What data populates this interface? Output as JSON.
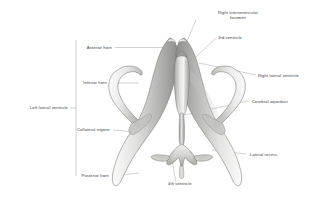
{
  "figure": {
    "view": "anterior-superior oblique",
    "style": "pencil-shaded anatomical illustration",
    "colors": {
      "leader_line": "#8c8c8c",
      "label_text": "#3c3c3c",
      "background": "#ffffff",
      "cast_light": "#f2f2f0",
      "cast_mid": "#c9c9c6",
      "cast_dark": "#8e8e8b",
      "outline": "#5a5a58"
    }
  },
  "labels": {
    "anterior_horn": "Anterior horn",
    "inferior_horn": "Inferior horn",
    "left_lateral_ventricle": "Left lateral ventricle",
    "collateral_trigone": "Collateral trigone",
    "posterior_horn": "Posterior horn",
    "right_interventricular_foramen_line1": "Right interventricular",
    "right_interventricular_foramen_line2": "foramen",
    "third_ventricle": "3rd ventricle",
    "right_lateral_ventricle": "Right lateral ventricle",
    "cerebral_aqueduct": "Cerebral aqueduct",
    "lateral_recess": "Lateral recess",
    "fourth_ventricle": "4th ventricle"
  }
}
